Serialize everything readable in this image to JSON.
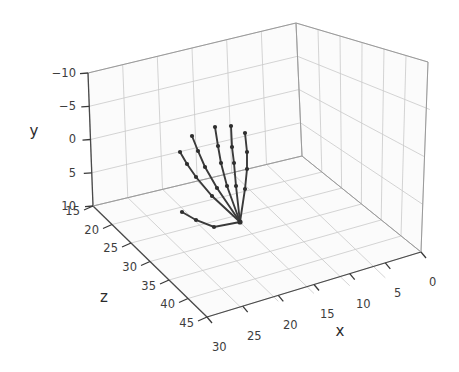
{
  "figure": {
    "type": "3d-scatter-line",
    "background_color": "#ffffff",
    "pane_color": "#fbfbfb",
    "grid_color": "#c9c9c9",
    "line_color": "#3a3a3a",
    "marker_color": "#2e2e2e"
  },
  "axes": {
    "x": {
      "label": "x",
      "ticks": [
        "0",
        "5",
        "10",
        "15",
        "20",
        "25",
        "30"
      ],
      "tick_values": [
        0,
        5,
        10,
        15,
        20,
        25,
        30
      ],
      "range": [
        0,
        30
      ],
      "direction": "increases-to-lower-left"
    },
    "y": {
      "label": "y",
      "ticks": [
        "−10",
        "−5",
        "0",
        "5",
        "10"
      ],
      "tick_values": [
        -10,
        -5,
        0,
        5,
        10
      ],
      "range": [
        -10,
        10
      ],
      "direction": "increases-downward"
    },
    "z": {
      "label": "z",
      "ticks": [
        "15",
        "20",
        "25",
        "30",
        "35",
        "40",
        "45"
      ],
      "tick_values": [
        15,
        20,
        25,
        30,
        35,
        40,
        45
      ],
      "range": [
        15,
        45
      ],
      "direction": "increases-to-lower-left"
    }
  },
  "chart_data": {
    "type": "scatter",
    "title": "",
    "xlabel": "x",
    "ylabel": "y",
    "zlabel": "z",
    "xlim": [
      0,
      30
    ],
    "ylim": [
      -10,
      10
    ],
    "zlim": [
      15,
      45
    ],
    "grid": true,
    "legend": "none",
    "series": [
      {
        "name": "thumb",
        "screen_points": [
          [
            240,
            222
          ],
          [
            214,
            227
          ],
          [
            196,
            220
          ],
          [
            182,
            212
          ]
        ]
      },
      {
        "name": "index",
        "screen_points": [
          [
            240,
            222
          ],
          [
            212,
            196
          ],
          [
            196,
            177
          ],
          [
            187,
            164
          ],
          [
            180,
            152
          ]
        ]
      },
      {
        "name": "middle",
        "screen_points": [
          [
            240,
            222
          ],
          [
            217,
            188
          ],
          [
            205,
            167
          ],
          [
            198,
            151
          ],
          [
            192,
            136
          ]
        ]
      },
      {
        "name": "ring",
        "screen_points": [
          [
            240,
            222
          ],
          [
            227,
            186
          ],
          [
            221,
            163
          ],
          [
            218,
            146
          ],
          [
            215,
            127
          ]
        ]
      },
      {
        "name": "pinky",
        "screen_points": [
          [
            240,
            222
          ],
          [
            236,
            186
          ],
          [
            234,
            163
          ],
          [
            232,
            147
          ],
          [
            231,
            126
          ]
        ]
      },
      {
        "name": "little",
        "screen_points": [
          [
            240,
            222
          ],
          [
            245,
            189
          ],
          [
            247,
            169
          ],
          [
            247,
            152
          ],
          [
            245,
            133
          ]
        ]
      }
    ]
  },
  "geometry": {
    "corners": {
      "back_top_left": [
        88,
        73
      ],
      "back_top_apex": [
        296,
        23
      ],
      "right_top": [
        428,
        62
      ],
      "back_bottom_left": [
        93,
        206
      ],
      "center_bottom": [
        302,
        156
      ],
      "right_bottom": [
        421,
        252
      ],
      "front_bottom": [
        207,
        317
      ]
    }
  }
}
